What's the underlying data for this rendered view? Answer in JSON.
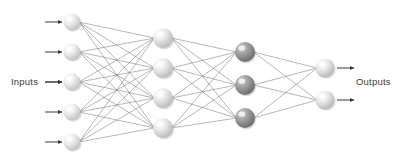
{
  "diagram": {
    "type": "neural-network",
    "background_color": "#ffffff",
    "labels": {
      "inputs": "Inputs",
      "outputs": "Outputs"
    },
    "edge_color": "#6e6e6e",
    "edge_width": 0.5,
    "arrow_color": "#3a3a3a",
    "layers": [
      {
        "id": "input-layer",
        "name": "input",
        "node_count": 5,
        "cx": 72,
        "r": 8.5,
        "fill": "#e2e2e2",
        "highlight": "#fbfbfb",
        "shadow": "#bdbdbd",
        "nodes_y": [
          22,
          52,
          82,
          112,
          142
        ]
      },
      {
        "id": "hidden-layer-1",
        "name": "hidden-1",
        "node_count": 4,
        "cx": 163,
        "r": 10,
        "fill": "#e0e0e0",
        "highlight": "#fcfcfc",
        "shadow": "#b5b5b5",
        "nodes_y": [
          38,
          68,
          98,
          128
        ]
      },
      {
        "id": "hidden-layer-2",
        "name": "hidden-2",
        "node_count": 3,
        "cx": 245,
        "r": 10,
        "fill": "#9a9a9a",
        "highlight": "#cfcfcf",
        "shadow": "#6f6f6f",
        "nodes_y": [
          52,
          85,
          118
        ]
      },
      {
        "id": "output-layer",
        "name": "output",
        "node_count": 2,
        "cx": 325,
        "r": 9.5,
        "fill": "#dedede",
        "highlight": "#fafafa",
        "shadow": "#b0b0b0",
        "nodes_y": [
          68,
          100
        ]
      }
    ],
    "input_arrows": [
      {
        "x1": 45,
        "x2": 62,
        "y": 22
      },
      {
        "x1": 45,
        "x2": 62,
        "y": 52
      },
      {
        "x1": 45,
        "x2": 62,
        "y": 82
      },
      {
        "x1": 45,
        "x2": 62,
        "y": 112
      },
      {
        "x1": 45,
        "x2": 62,
        "y": 142
      }
    ],
    "output_arrows": [
      {
        "x1": 337,
        "x2": 354,
        "y": 68
      },
      {
        "x1": 337,
        "x2": 354,
        "y": 100
      }
    ],
    "connections": [
      {
        "from": "input-layer",
        "to": "hidden-layer-1",
        "fully_connected": true
      },
      {
        "from": "hidden-layer-1",
        "to": "hidden-layer-2",
        "fully_connected": true
      },
      {
        "from": "hidden-layer-2",
        "to": "output-layer",
        "fully_connected": true
      }
    ]
  }
}
